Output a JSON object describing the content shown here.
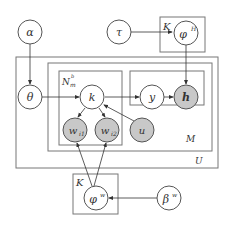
{
  "diagram": {
    "type": "plate-notation graphical model",
    "colors": {
      "observed_fill": "#c8c8c8",
      "latent_fill": "#ffffff",
      "stroke": "#555555",
      "plate_stroke": "#777777"
    },
    "nodes": {
      "alpha": {
        "label": "α",
        "observed": false
      },
      "tau": {
        "label": "τ",
        "observed": false
      },
      "phi_h": {
        "label": "φ",
        "sup": "H",
        "observed": false
      },
      "theta": {
        "label": "θ",
        "observed": false
      },
      "k": {
        "label": "k",
        "observed": false
      },
      "y": {
        "label": "y",
        "observed": false
      },
      "h": {
        "label": "h",
        "observed": true
      },
      "w_i1": {
        "label": "w",
        "sub": "i1",
        "observed": true
      },
      "w_i2": {
        "label": "w",
        "sub": "i2",
        "observed": true
      },
      "u": {
        "label": "u",
        "observed": true
      },
      "phi_w": {
        "label": "φ",
        "sup": "w",
        "observed": false
      },
      "beta_w": {
        "label": "β",
        "sup": "w",
        "observed": false
      }
    },
    "plates": {
      "K_top": {
        "label": "K"
      },
      "U": {
        "label": "U"
      },
      "M": {
        "label": "M"
      },
      "N": {
        "label": "N",
        "sub": "m",
        "sup": "b"
      },
      "K_bottom": {
        "label": "K"
      }
    },
    "edges": [
      [
        "alpha",
        "theta"
      ],
      [
        "tau",
        "phi_h"
      ],
      [
        "phi_h",
        "h"
      ],
      [
        "theta",
        "k"
      ],
      [
        "k",
        "y"
      ],
      [
        "y",
        "h"
      ],
      [
        "k",
        "w_i1"
      ],
      [
        "k",
        "w_i2"
      ],
      [
        "u",
        "k"
      ],
      [
        "phi_w",
        "w_i1"
      ],
      [
        "phi_w",
        "w_i2"
      ],
      [
        "beta_w",
        "phi_w"
      ]
    ]
  }
}
